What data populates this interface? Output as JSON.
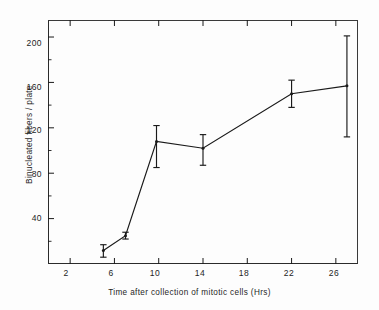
{
  "chart_data": {
    "type": "line",
    "title": "",
    "xlabel": "Time after collection of mitotic cells (Hrs)",
    "ylabel": "Binucleated fibers / plate",
    "xlim": [
      0,
      28
    ],
    "ylim": [
      0,
      215
    ],
    "xticks": [
      2,
      6,
      10,
      14,
      18,
      22,
      26
    ],
    "xtick_labels": [
      "2",
      "6",
      "10",
      "14",
      "18",
      "22",
      "26"
    ],
    "yticks": [
      40,
      80,
      120,
      160,
      200
    ],
    "ytick_labels": [
      "40",
      "80",
      "120",
      "160",
      "200"
    ],
    "minor_yticks": [
      20,
      60,
      100,
      140,
      180
    ],
    "grid": false,
    "legend": null,
    "series": [
      {
        "name": "Binucleated fibers per plate",
        "marker": "none",
        "line_color": "#1a1a1a",
        "x": [
          5.0,
          7.0,
          9.8,
          14.0,
          22.0,
          27.0
        ],
        "y": [
          12,
          25,
          108,
          102,
          150,
          157
        ],
        "yerr_low": [
          6,
          3,
          23,
          15,
          12,
          45
        ],
        "yerr_high": [
          5,
          3,
          14,
          12,
          12,
          44
        ]
      }
    ]
  },
  "axes": {
    "x_title": "Time after collection of mitotic cells (Hrs)",
    "y_title": "Binucleated fibers / plate"
  }
}
